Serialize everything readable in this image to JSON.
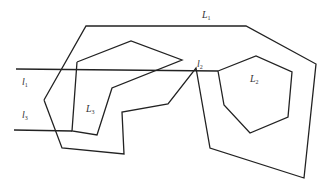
{
  "diagram": {
    "background": "#ffffff",
    "stroke_color": "#222222",
    "shapes": {
      "L1": {
        "name": "L",
        "sub": "1",
        "type": "polygon",
        "points": "44,100 86,26 246,26 316,64 304,178 210,148 196,68 168,104 122,112 124,154 62,148 44,100"
      },
      "L2": {
        "name": "L",
        "sub": "2",
        "type": "polygon",
        "points": "218,71 256,56 292,72 288,117 250,133 224,105 218,71"
      },
      "L3": {
        "name": "L",
        "sub": "3",
        "type": "polygon",
        "points": "77,62 131,41 182,60 112,88 97,135 72,131 77,62"
      },
      "l1": {
        "name": "l",
        "sub": "1",
        "type": "line",
        "points": "16,69 218,71"
      },
      "l3": {
        "name": "l",
        "sub": "3",
        "type": "line",
        "points": "14,130 72,131"
      }
    },
    "labels": [
      {
        "id": "L1",
        "text": "L",
        "sub": "1",
        "x": 202,
        "y": 10
      },
      {
        "id": "L2",
        "text": "L",
        "sub": "2",
        "x": 250,
        "y": 74
      },
      {
        "id": "L3",
        "text": "L",
        "sub": "3",
        "x": 86,
        "y": 104
      },
      {
        "id": "l1",
        "text": "l",
        "sub": "1",
        "x": 22,
        "y": 77
      },
      {
        "id": "l2",
        "text": "l",
        "sub": "2",
        "x": 197,
        "y": 59
      },
      {
        "id": "l3",
        "text": "l",
        "sub": "3",
        "x": 22,
        "y": 110
      }
    ]
  }
}
